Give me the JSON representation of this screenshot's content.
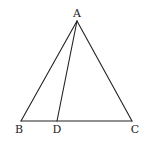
{
  "diagram": {
    "type": "triangle-with-cevian",
    "stroke_color": "#222222",
    "background": "#ffffff",
    "points": {
      "A": {
        "label": "A",
        "x": 77,
        "y": 21,
        "label_x": 77,
        "label_y": 17
      },
      "B": {
        "label": "B",
        "x": 21,
        "y": 121,
        "label_x": 19,
        "label_y": 133
      },
      "D": {
        "label": "D",
        "x": 57,
        "y": 121,
        "label_x": 57,
        "label_y": 133
      },
      "C": {
        "label": "C",
        "x": 132,
        "y": 121,
        "label_x": 135,
        "label_y": 133
      }
    },
    "segments": [
      {
        "from": "A",
        "to": "B"
      },
      {
        "from": "A",
        "to": "C"
      },
      {
        "from": "B",
        "to": "C"
      },
      {
        "from": "A",
        "to": "D"
      }
    ]
  }
}
